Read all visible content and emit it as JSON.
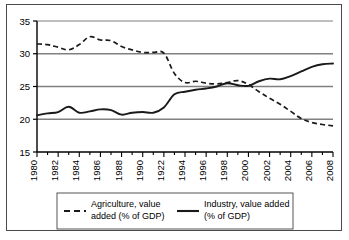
{
  "chart_data": {
    "type": "line",
    "title": "",
    "xlabel": "",
    "ylabel": "",
    "xlim": [
      1980,
      2008
    ],
    "ylim": [
      15,
      35
    ],
    "yticks": [
      15,
      20,
      25,
      30,
      35
    ],
    "ytick_labels": [
      "15",
      "20",
      "25",
      "30",
      "35"
    ],
    "grid": "horizontal",
    "legend_position": "bottom",
    "x": [
      1980,
      1981,
      1982,
      1983,
      1984,
      1985,
      1986,
      1987,
      1988,
      1989,
      1990,
      1991,
      1992,
      1993,
      1994,
      1995,
      1996,
      1997,
      1998,
      1999,
      2000,
      2001,
      2002,
      2003,
      2004,
      2005,
      2006,
      2007,
      2008
    ],
    "xtick_labels": [
      "1980",
      "1982",
      "1984",
      "1986",
      "1988",
      "1990",
      "1922",
      "1994",
      "1996",
      "1998",
      "2000",
      "2002",
      "2004",
      "2006",
      "2008"
    ],
    "xtick_values": [
      1980,
      1982,
      1984,
      1986,
      1988,
      1990,
      1992,
      1994,
      1996,
      1998,
      2000,
      2002,
      2004,
      2006,
      2008
    ],
    "series": [
      {
        "name": "Agriculture, value added (% of GDP)",
        "style": "dashed",
        "color": "#1a1a1a",
        "values": [
          31.5,
          31.4,
          31.0,
          30.6,
          31.4,
          32.6,
          32.1,
          32.0,
          31.1,
          30.6,
          30.2,
          30.2,
          30.1,
          27.0,
          25.6,
          25.8,
          25.5,
          25.4,
          25.6,
          25.9,
          25.3,
          24.2,
          23.2,
          22.3,
          21.2,
          20.1,
          19.5,
          19.2,
          19.0
        ]
      },
      {
        "name": "Industry, value added (% of GDP)",
        "style": "solid",
        "color": "#1a1a1a",
        "values": [
          20.6,
          20.9,
          21.1,
          21.9,
          21.0,
          21.2,
          21.5,
          21.4,
          20.7,
          21.0,
          21.1,
          21.0,
          21.8,
          23.8,
          24.2,
          24.5,
          24.7,
          25.0,
          25.5,
          25.2,
          25.1,
          25.8,
          26.2,
          26.1,
          26.6,
          27.3,
          28.0,
          28.4,
          28.5
        ]
      }
    ]
  },
  "legend": {
    "entries": [
      {
        "label": "Agriculture, value added (% of GDP)",
        "line_1": "Agriculture, value",
        "line_2": "added (% of GDP)",
        "marker": "dashed-line-swatch"
      },
      {
        "label": "Industry, value added (% of GDP)",
        "line_1": "Industry, value added",
        "line_2": "(% of GDP)",
        "marker": "solid-line-swatch"
      }
    ]
  },
  "colors": {
    "axis": "#000000",
    "gridline": "#808080",
    "series_line": "#1a1a1a",
    "figure_border": "#4a4a4a",
    "background": "#ffffff"
  }
}
